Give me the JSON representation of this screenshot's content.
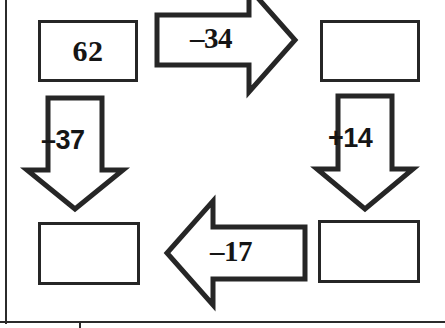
{
  "diagram": {
    "type": "arrow-flow-number-chain",
    "background_color": "#ffffff",
    "ink_color": "#262626",
    "boxes": [
      {
        "name": "start",
        "value": "62",
        "empty": false
      },
      {
        "name": "top-right",
        "value": "",
        "empty": true
      },
      {
        "name": "bottom-right",
        "value": "",
        "empty": true
      },
      {
        "name": "bottom-left",
        "value": "",
        "empty": true
      }
    ],
    "arrows": [
      {
        "name": "right",
        "direction": "right",
        "label": "–34"
      },
      {
        "name": "down-right",
        "direction": "down",
        "label": "+14"
      },
      {
        "name": "left",
        "direction": "left",
        "label": "–17"
      },
      {
        "name": "down-left",
        "direction": "down",
        "label": "–37"
      }
    ],
    "rules": {
      "left_margin_line": true,
      "bottom_line": true
    }
  }
}
